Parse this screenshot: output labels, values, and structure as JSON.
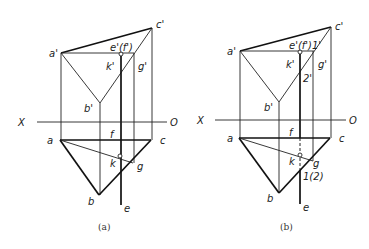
{
  "figure_a": {
    "caption": "(a)",
    "labels": {
      "a_prime": "a'",
      "b_prime": "b'",
      "c_prime": "c'",
      "ef_prime": "e'(f')",
      "k_prime": "k'",
      "g_prime": "g'",
      "x_axis": "X",
      "o_axis": "O",
      "a": "a",
      "b": "b",
      "c": "c",
      "f": "f",
      "k": "k",
      "g": "g",
      "e": "e"
    }
  },
  "figure_b": {
    "caption": "(b)",
    "labels": {
      "a_prime": "a'",
      "b_prime": "b'",
      "c_prime": "c'",
      "ef1_prime": "e'(f')1'",
      "k_prime": "k'",
      "g_prime": "g'",
      "two_prime": "2'",
      "x_axis": "X",
      "o_axis": "O",
      "a": "a",
      "b": "b",
      "c": "c",
      "f": "f",
      "k": "k",
      "g": "g",
      "one_two": "1(2)",
      "e": "e"
    }
  }
}
